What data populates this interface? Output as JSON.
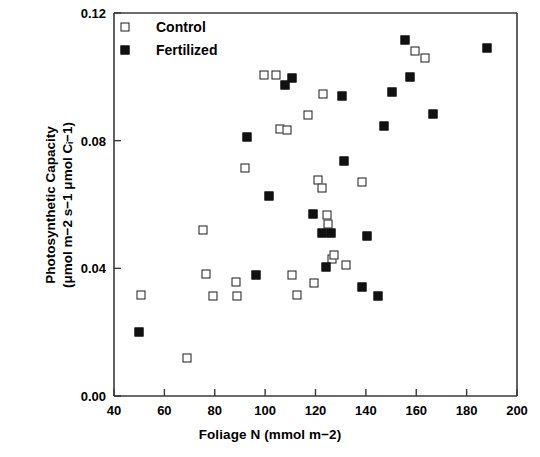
{
  "chart_data": {
    "type": "scatter",
    "title": "",
    "xlabel": "Foliage N (mmol m−2)",
    "ylabel_line1": "Photosynthetic Capacity",
    "ylabel_line2": "(μmol m−2 s−1 μmol Cᵢ−1)",
    "xlim": [
      40,
      200
    ],
    "ylim": [
      0.0,
      0.12
    ],
    "xticks": [
      40,
      60,
      80,
      100,
      120,
      140,
      160,
      180,
      200
    ],
    "xtick_labels": [
      "40",
      "60",
      "80",
      "100",
      "120",
      "140",
      "160",
      "180",
      "200"
    ],
    "yticks": [
      0.0,
      0.04,
      0.08,
      0.12
    ],
    "ytick_labels": [
      "0.00",
      "0.04",
      "0.08",
      "0.12"
    ],
    "grid": false,
    "legend_position": "top-left",
    "marker_color": "#111111",
    "frame_color": "#3a3a3a",
    "series": [
      {
        "name": "Control",
        "marker": "open-square",
        "points": [
          [
            50.7,
            0.0316
          ],
          [
            69.0,
            0.012
          ],
          [
            75.5,
            0.052
          ],
          [
            76.5,
            0.0382
          ],
          [
            79.5,
            0.0312
          ],
          [
            88.5,
            0.0356
          ],
          [
            89.0,
            0.0312
          ],
          [
            92.0,
            0.0713
          ],
          [
            99.5,
            0.1005
          ],
          [
            104.5,
            0.1005
          ],
          [
            106.0,
            0.0836
          ],
          [
            108.5,
            0.0834
          ],
          [
            110.5,
            0.038
          ],
          [
            112.5,
            0.0316
          ],
          [
            117.0,
            0.088
          ],
          [
            119.5,
            0.0355
          ],
          [
            121.0,
            0.0676
          ],
          [
            122.5,
            0.0652
          ],
          [
            123.0,
            0.0946
          ],
          [
            124.5,
            0.0568
          ],
          [
            125.0,
            0.054
          ],
          [
            126.5,
            0.043
          ],
          [
            127.5,
            0.0443
          ],
          [
            132.0,
            0.041
          ],
          [
            138.5,
            0.0671
          ],
          [
            159.5,
            0.108
          ],
          [
            163.5,
            0.106
          ]
        ]
      },
      {
        "name": "Fertilized",
        "marker": "filled-square",
        "points": [
          [
            50.0,
            0.02
          ],
          [
            93.0,
            0.081
          ],
          [
            96.5,
            0.038
          ],
          [
            101.5,
            0.0628
          ],
          [
            108.0,
            0.0975
          ],
          [
            110.5,
            0.0995
          ],
          [
            119.0,
            0.057
          ],
          [
            122.5,
            0.051
          ],
          [
            124.0,
            0.0403
          ],
          [
            126.0,
            0.0512
          ],
          [
            130.5,
            0.094
          ],
          [
            131.5,
            0.0735
          ],
          [
            138.5,
            0.0342
          ],
          [
            140.5,
            0.0502
          ],
          [
            145.0,
            0.0314
          ],
          [
            147.0,
            0.0845
          ],
          [
            150.5,
            0.0952
          ],
          [
            155.5,
            0.1115
          ],
          [
            157.5,
            0.0998
          ],
          [
            166.5,
            0.0882
          ],
          [
            188.0,
            0.109
          ]
        ]
      }
    ]
  },
  "legend": {
    "items": [
      {
        "label": "Control",
        "marker": "open-square"
      },
      {
        "label": "Fertilized",
        "marker": "filled-square"
      }
    ]
  }
}
